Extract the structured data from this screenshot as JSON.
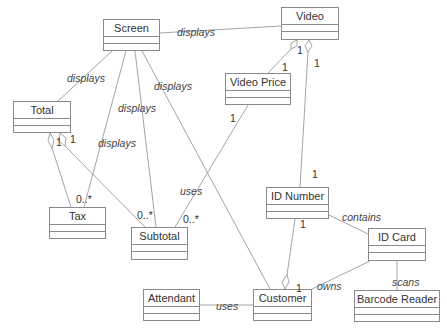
{
  "diagram": {
    "type": "UML class diagram",
    "classes": [
      {
        "id": "screen",
        "name": "Screen"
      },
      {
        "id": "video",
        "name": "Video"
      },
      {
        "id": "total",
        "name": "Total"
      },
      {
        "id": "video_price",
        "name": "Video Price"
      },
      {
        "id": "tax",
        "name": "Tax"
      },
      {
        "id": "subtotal",
        "name": "Subtotal"
      },
      {
        "id": "id_number",
        "name": "ID Number"
      },
      {
        "id": "id_card",
        "name": "ID Card"
      },
      {
        "id": "attendant",
        "name": "Attendant"
      },
      {
        "id": "customer",
        "name": "Customer"
      },
      {
        "id": "barcode_reader",
        "name": "Barcode Reader"
      }
    ],
    "associations": [
      {
        "from": "Screen",
        "to": "Video",
        "label": "displays"
      },
      {
        "from": "Screen",
        "to": "Total",
        "label": "displays"
      },
      {
        "from": "Screen",
        "to": "Tax",
        "label": "displays",
        "to_mult": "0..*"
      },
      {
        "from": "Screen",
        "to": "Subtotal",
        "label": "displays"
      },
      {
        "from": "Screen",
        "to": "Customer",
        "label": "displays"
      },
      {
        "from": "Total",
        "to": "Tax",
        "kind": "aggregation",
        "from_mult": "1"
      },
      {
        "from": "Total",
        "to": "Subtotal",
        "kind": "aggregation",
        "from_mult": "1",
        "to_mult": "0..*"
      },
      {
        "from": "Video",
        "to": "Video Price",
        "kind": "aggregation",
        "from_mult": "1",
        "to_mult": "1"
      },
      {
        "from": "Video",
        "to": "ID Number",
        "kind": "aggregation",
        "from_mult": "1",
        "to_mult": "1"
      },
      {
        "from": "Video Price",
        "to": "Subtotal",
        "label": "uses",
        "from_mult": "1",
        "to_mult": "0..*"
      },
      {
        "from": "ID Number",
        "to": "ID Card",
        "label": "contains"
      },
      {
        "from": "Customer",
        "to": "ID Number",
        "kind": "aggregation",
        "from_mult": "1",
        "to_mult": "1"
      },
      {
        "from": "Customer",
        "to": "ID Card",
        "label": "owns"
      },
      {
        "from": "ID Card",
        "to": "Barcode Reader",
        "label": "scans"
      },
      {
        "from": "Attendant",
        "to": "Customer",
        "label": "uses"
      }
    ],
    "labels": {
      "displays": "displays",
      "uses": "uses",
      "contains": "contains",
      "owns": "owns",
      "scans": "scans"
    },
    "multiplicities": {
      "one": "1",
      "many": "0..*"
    }
  }
}
